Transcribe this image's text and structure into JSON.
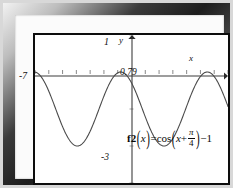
{
  "chart_data": {
    "type": "line",
    "title": "",
    "equation_text": "f2(x)=cos(x+π/4)−1",
    "function": "cos(x + pi/4) - 1",
    "xlabel": "x",
    "ylabel": "y",
    "xlim": [
      -7,
      7
    ],
    "ylim": [
      -3,
      1
    ],
    "grid": false,
    "legend": "none",
    "axis_labels": {
      "y_top": "1",
      "y_bottom": "-3",
      "x_left": "-7",
      "x_axis_name": "x",
      "y_axis_name": "y",
      "root_label": "0.79"
    },
    "annotations": [
      {
        "text": "1",
        "x": -0.45,
        "y": 1.0,
        "note": "y-axis top tick label"
      },
      {
        "text": "-3",
        "x": -0.55,
        "y": -2.8,
        "note": "y-axis bottom label"
      },
      {
        "text": "-7",
        "x": -6.75,
        "y": -0.18,
        "note": "x-axis left endpoint"
      },
      {
        "text": "0.79",
        "x": 0.15,
        "y": -0.17,
        "note": "zero crossing x = pi/4 approx 0.79"
      },
      {
        "text": "x",
        "x": 6.55,
        "y": 0.3,
        "note": "x-axis arrow label"
      },
      {
        "text": "y",
        "x": 0.3,
        "y": 1.05,
        "note": "y-axis arrow label"
      }
    ],
    "series": [
      {
        "name": "f2",
        "color": "#4a4a4a",
        "x": [
          -7.0,
          -6.65,
          -6.3,
          -5.95,
          -5.6,
          -5.25,
          -4.9,
          -4.55,
          -4.2,
          -3.85,
          -3.5,
          -3.15,
          -2.8,
          -2.45,
          -2.1,
          -1.75,
          -1.4,
          -1.05,
          -0.79,
          -0.45,
          -0.1,
          0.25,
          0.6,
          0.79,
          1.1,
          1.45,
          1.8,
          2.15,
          2.5,
          2.85,
          3.2,
          3.55,
          3.9,
          4.25,
          4.6,
          4.95,
          5.3,
          5.5,
          5.85,
          6.2,
          6.55,
          7.0
        ],
        "y": [
          -0.24,
          -0.49,
          -0.81,
          -1.17,
          -1.52,
          -1.81,
          -1.97,
          -2.0,
          -1.87,
          -1.62,
          -1.28,
          -0.92,
          -0.58,
          -0.3,
          -0.11,
          -0.01,
          -0.02,
          -0.14,
          0.0,
          -0.29,
          -0.6,
          -0.93,
          -1.27,
          0.0,
          -1.77,
          -1.95,
          -2.0,
          -1.9,
          -1.67,
          -1.35,
          -1.0,
          -0.66,
          -0.36,
          -0.14,
          -0.02,
          -0.01,
          -0.12,
          0.0,
          -0.47,
          -0.79,
          -1.14,
          -1.58
        ],
        "ymin": -2.0,
        "ymax": 0.0,
        "period": 6.283,
        "phase_shift": -0.785,
        "vertical_shift": -1,
        "amplitude": 1,
        "maxima_x": [
          -0.785,
          5.498
        ],
        "minima_x": [
          -4.0,
          2.356
        ],
        "note": "Peaks touch y = 0, troughs reach y = -2"
      }
    ]
  },
  "frame": {
    "style": "beveled-picture-frame",
    "outer_color": "#d8d8d8",
    "bevel_dark": "#1d1d1d",
    "mat_color": "#fbfbfb",
    "plot_border_color": "#0d0d0d"
  },
  "equation": {
    "function_name": "f2",
    "open_arg": "(",
    "arg": "x",
    "close_arg": ")",
    "equals": "=",
    "cos": "cos",
    "open_paren": "(",
    "inner_var": "x",
    "plus": "+",
    "numerator": "π",
    "denominator": "4",
    "close_paren": ")",
    "minus_one": "−1"
  }
}
